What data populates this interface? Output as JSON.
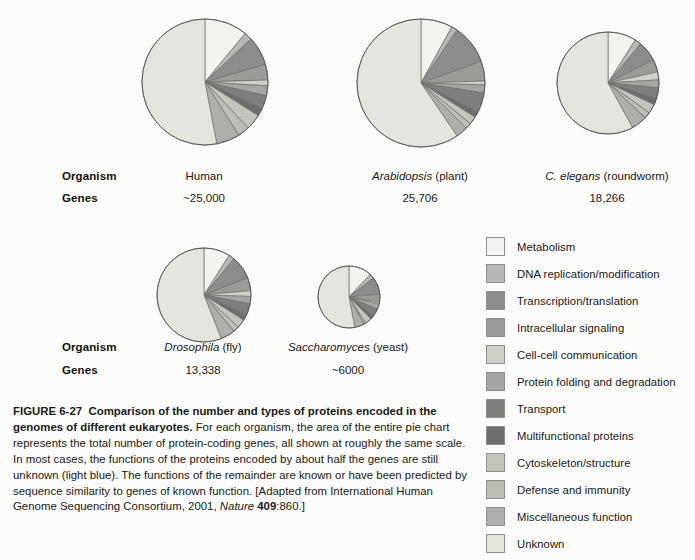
{
  "figure": {
    "number": "FIGURE 6-27",
    "title": "Comparison of the number and types of proteins encoded in the genomes of different eukaryotes.",
    "body_1": " For each organism, the area of the entire pie chart represents the total number of protein-coding genes, all shown at roughly the same scale. In most cases, the functions of the proteins encoded by about half the genes are still unknown (light blue). The functions of the remainder are known or have been predicted by sequence similarity to genes of known function. [Adapted from International Human Genome Sequencing Consortium, 2001, ",
    "source_journal": "Nature",
    "source_volume": "409",
    "source_pages": ":860.]"
  },
  "table": {
    "row_label_organism": "Organism",
    "row_label_genes": "Genes"
  },
  "chart_data": {
    "type": "pie",
    "title": "Comparison of the number and types of proteins encoded in the genomes of different eukaryotes",
    "legend_position": "right",
    "categories": [
      "Metabolism",
      "DNA replication/modification",
      "Transcription/translation",
      "Intracellular signaling",
      "Cell-cell communication",
      "Protein folding and degradation",
      "Transport",
      "Multifunctional proteins",
      "Cytoskeleton/structure",
      "Defense and immunity",
      "Miscellaneous function",
      "Unknown"
    ],
    "category_colors": [
      "#f3f2ee",
      "#b8b8b4",
      "#8c8c8a",
      "#9a9a97",
      "#cfcfca",
      "#a5a5a1",
      "#7e7e7c",
      "#6e6e6c",
      "#c4c4bf",
      "#bdbdb8",
      "#aeaeaa",
      "#e4e4df"
    ],
    "series": [
      {
        "name": "Human",
        "organism_display": "Human",
        "organism_species": "",
        "organism_common": "Human",
        "genes": "~25,000",
        "genes_numeric": 25000,
        "radius_px": 63,
        "values": [
          11.0,
          2.0,
          7.5,
          4.0,
          1.5,
          2.5,
          3.5,
          2.0,
          4.0,
          3.0,
          6.0,
          53.0
        ]
      },
      {
        "name": "Arabidopsis",
        "organism_display": "Arabidopsis (plant)",
        "organism_species": "Arabidopsis",
        "organism_common": " (plant)",
        "genes": "25,706",
        "genes_numeric": 25706,
        "radius_px": 64,
        "values": [
          8.0,
          1.5,
          10.0,
          5.0,
          1.0,
          2.0,
          5.0,
          1.5,
          2.0,
          1.5,
          3.0,
          59.5
        ]
      },
      {
        "name": "C. elegans",
        "organism_display": "C. elegans (roundworm)",
        "organism_species": "C. elegans",
        "organism_common": " (roundworm)",
        "genes": "18,266",
        "genes_numeric": 18266,
        "radius_px": 51,
        "values": [
          9.0,
          2.0,
          6.5,
          4.0,
          2.5,
          2.5,
          3.5,
          2.0,
          3.0,
          2.0,
          5.0,
          58.0
        ]
      },
      {
        "name": "Drosophila",
        "organism_display": "Drosophila (fly)",
        "organism_species": "Drosophila",
        "organism_common": " (fly)",
        "genes": "13,338",
        "genes_numeric": 13338,
        "radius_px": 47,
        "values": [
          9.0,
          2.0,
          8.0,
          4.5,
          2.0,
          2.5,
          4.0,
          2.0,
          3.0,
          2.0,
          5.0,
          56.0
        ]
      },
      {
        "name": "Saccharomyces",
        "organism_display": "Saccharomyces (yeast)",
        "organism_species": "Saccharomyces",
        "organism_common": " (yeast)",
        "genes": "~6000",
        "genes_numeric": 6000,
        "radius_px": 31,
        "values": [
          12.0,
          2.5,
          9.0,
          4.0,
          1.0,
          3.0,
          4.0,
          2.0,
          3.5,
          1.0,
          5.0,
          53.0
        ]
      }
    ]
  }
}
